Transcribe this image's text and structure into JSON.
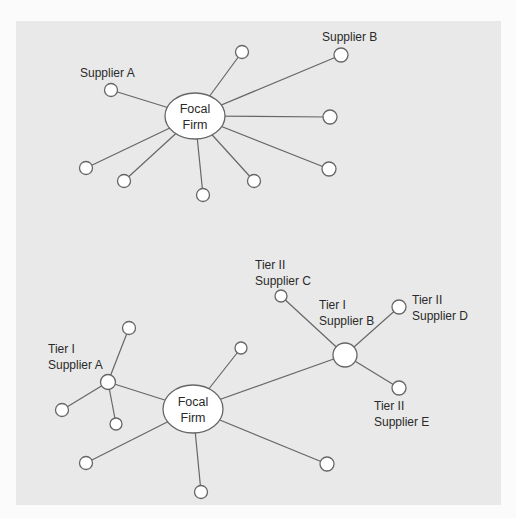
{
  "colors": {
    "page_background": "#fbfbfb",
    "panel_background": "#e9e9e9",
    "edge": "#666666",
    "node_fill": "#ffffff",
    "text": "#2a2a2a"
  },
  "top_diagram": {
    "focal": {
      "line1": "Focal",
      "line2": "Firm"
    },
    "labels": {
      "supplier_a": "Supplier A",
      "supplier_b": "Supplier B"
    }
  },
  "bottom_diagram": {
    "focal": {
      "line1": "Focal",
      "line2": "Firm"
    },
    "labels": {
      "tier1_a_line1": "Tier I",
      "tier1_a_line2": "Supplier A",
      "tier1_b_line1": "Tier I",
      "tier1_b_line2": "Supplier B",
      "tier2_c_line1": "Tier II",
      "tier2_c_line2": "Supplier C",
      "tier2_d_line1": "Tier II",
      "tier2_d_line2": "Supplier D",
      "tier2_e_line1": "Tier II",
      "tier2_e_line2": "Supplier E"
    }
  }
}
